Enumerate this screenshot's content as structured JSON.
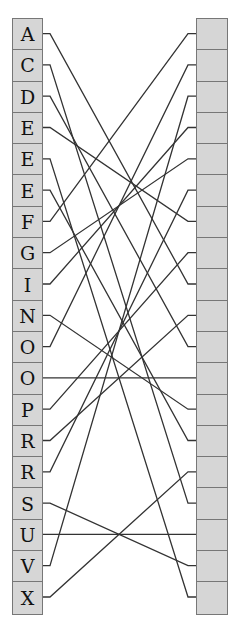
{
  "diagram": {
    "type": "matching",
    "left_labels": [
      "A",
      "C",
      "D",
      "E",
      "E",
      "E",
      "F",
      "G",
      "I",
      "N",
      "O",
      "O",
      "P",
      "R",
      "R",
      "S",
      "U",
      "V",
      "X"
    ],
    "right_count": 19,
    "connections": [
      8,
      15,
      10,
      6,
      18,
      13,
      0,
      4,
      3,
      12,
      1,
      11,
      7,
      9,
      5,
      17,
      16,
      2,
      14
    ],
    "colors": {
      "cell_fill": "#d6d6d6",
      "cell_border": "#777777",
      "wire": "#333333"
    }
  }
}
